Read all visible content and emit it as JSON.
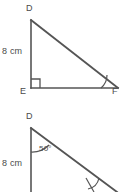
{
  "canvas": {
    "width": 124,
    "height": 192,
    "background": "#ffffff",
    "stroke_color": "#555555",
    "text_color": "#4a4a4a"
  },
  "figures": [
    {
      "id": "triangle-def-top",
      "description": "Right triangle D E F with right angle at E",
      "vertices": {
        "d": "D",
        "e": "E",
        "f": "F"
      },
      "side_labels": {
        "de": "8 cm"
      },
      "markers": {
        "right_angle_at": "E",
        "angle_arc_at": "F",
        "angle_arc_label": ""
      }
    },
    {
      "id": "triangle-def-bottom",
      "description": "Right triangle D E F, cropped, with 50 degree angle marked at D",
      "vertices": {
        "d": "D"
      },
      "side_labels": {
        "de": "8 cm"
      },
      "markers": {
        "angle_arc_at": "D",
        "angle_arc_label": "50°"
      }
    }
  ]
}
